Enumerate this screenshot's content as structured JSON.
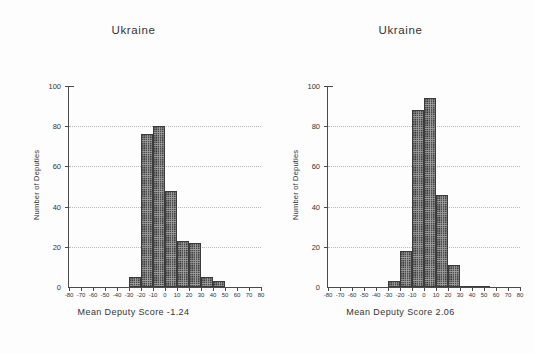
{
  "figure": {
    "background": "#fdfdfd",
    "bar_fill": "#9e9e9e",
    "bar_edge": "#3b3b3b",
    "grid_color": "#b9b9b9",
    "axis_color": "#4a4a4a"
  },
  "panels": [
    {
      "id": "left",
      "title": "Ukraine",
      "ylabel": "Number of Deputies",
      "xlabel": "Mean Deputy Score -1.24"
    },
    {
      "id": "right",
      "title": "Ukraine",
      "ylabel": "Number of Deputies",
      "xlabel": "Mean Deputy Score 2.06"
    }
  ],
  "chart_data": [
    {
      "type": "bar",
      "title": "Ukraine",
      "xlabel": "Mean Deputy Score -1.24",
      "ylabel": "Number of Deputies",
      "xlim": [
        -80,
        80
      ],
      "ylim": [
        0,
        100
      ],
      "xticks": [
        -80,
        -70,
        -60,
        -50,
        -40,
        -30,
        -20,
        -10,
        0,
        10,
        20,
        30,
        40,
        50,
        60,
        70,
        80
      ],
      "xtick_labels": [
        "-80",
        "-70",
        "-60",
        "-50",
        "-40",
        "-30",
        "-20",
        "-10",
        "0",
        "10",
        "20",
        "30",
        "40",
        "50",
        "60",
        "70",
        "80"
      ],
      "yticks": [
        0,
        20,
        40,
        60,
        80,
        100
      ],
      "ytick_labels": [
        "0",
        "20",
        "40",
        "60",
        "80",
        "100"
      ],
      "grid": "horizontal-dotted",
      "legend": "none",
      "bin_width": 10,
      "bins": [
        {
          "x0": -30,
          "x1": -20,
          "value": 5
        },
        {
          "x0": -20,
          "x1": -10,
          "value": 76
        },
        {
          "x0": -10,
          "x1": 0,
          "value": 80
        },
        {
          "x0": 0,
          "x1": 10,
          "value": 48
        },
        {
          "x0": 10,
          "x1": 20,
          "value": 23
        },
        {
          "x0": 20,
          "x1": 30,
          "value": 22
        },
        {
          "x0": 30,
          "x1": 40,
          "value": 5
        },
        {
          "x0": 40,
          "x1": 50,
          "value": 3
        }
      ],
      "annotations": [
        {
          "text": "Mean Deputy Score -1.24",
          "value": -1.24
        }
      ]
    },
    {
      "type": "bar",
      "title": "Ukraine",
      "xlabel": "Mean Deputy Score 2.06",
      "ylabel": "Number of Deputies",
      "xlim": [
        -80,
        80
      ],
      "ylim": [
        0,
        100
      ],
      "xticks": [
        -80,
        -70,
        -60,
        -50,
        -40,
        -30,
        -20,
        -10,
        0,
        10,
        20,
        30,
        40,
        50,
        60,
        70,
        80
      ],
      "xtick_labels": [
        "-80",
        "-70",
        "-60",
        "-50",
        "-40",
        "-30",
        "-20",
        "-10",
        "0",
        "10",
        "20",
        "30",
        "40",
        "50",
        "60",
        "70",
        "80"
      ],
      "yticks": [
        0,
        20,
        40,
        60,
        80,
        100
      ],
      "ytick_labels": [
        "0",
        "20",
        "40",
        "60",
        "80",
        "100"
      ],
      "grid": "horizontal-dotted",
      "legend": "none",
      "bin_width": 10,
      "bins": [
        {
          "x0": -30,
          "x1": -20,
          "value": 3
        },
        {
          "x0": -20,
          "x1": -10,
          "value": 18
        },
        {
          "x0": -10,
          "x1": 0,
          "value": 88
        },
        {
          "x0": 0,
          "x1": 10,
          "value": 94
        },
        {
          "x0": 10,
          "x1": 20,
          "value": 46
        },
        {
          "x0": 20,
          "x1": 30,
          "value": 11
        }
      ],
      "annotations": [
        {
          "text": "Mean Deputy Score 2.06",
          "value": 2.06
        }
      ]
    }
  ]
}
